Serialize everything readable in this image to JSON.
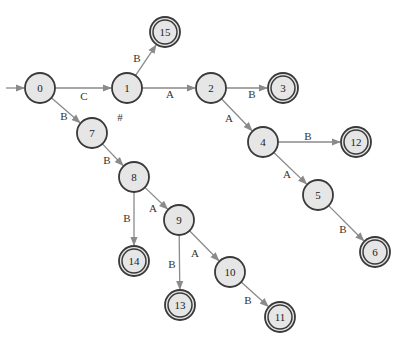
{
  "diagram": {
    "type": "state-machine",
    "colors": {
      "node_fill": "#e6e6e6",
      "node_stroke": "#3a3a3a",
      "edge": "#8a8a8a"
    },
    "start_state": "0",
    "nodes": [
      {
        "id": "0",
        "label": "0",
        "x": 40,
        "y": 88,
        "accepting": false
      },
      {
        "id": "1",
        "label": "1",
        "x": 127,
        "y": 88,
        "accepting": false
      },
      {
        "id": "2",
        "label": "2",
        "x": 211,
        "y": 88,
        "accepting": false
      },
      {
        "id": "3",
        "label": "3",
        "x": 283,
        "y": 88,
        "accepting": true
      },
      {
        "id": "15",
        "label": "15",
        "x": 165,
        "y": 32,
        "accepting": true
      },
      {
        "id": "7",
        "label": "7",
        "x": 92,
        "y": 133,
        "accepting": false
      },
      {
        "id": "8",
        "label": "8",
        "x": 134,
        "y": 177,
        "accepting": false
      },
      {
        "id": "4",
        "label": "4",
        "x": 263,
        "y": 142,
        "accepting": false
      },
      {
        "id": "12",
        "label": "12",
        "x": 356,
        "y": 142,
        "accepting": true
      },
      {
        "id": "5",
        "label": "5",
        "x": 318,
        "y": 195,
        "accepting": false
      },
      {
        "id": "6",
        "label": "6",
        "x": 375,
        "y": 252,
        "accepting": true
      },
      {
        "id": "9",
        "label": "9",
        "x": 179,
        "y": 220,
        "accepting": false
      },
      {
        "id": "14",
        "label": "14",
        "x": 134,
        "y": 261,
        "accepting": true
      },
      {
        "id": "10",
        "label": "10",
        "x": 230,
        "y": 272,
        "accepting": false
      },
      {
        "id": "13",
        "label": "13",
        "x": 180,
        "y": 305,
        "accepting": true
      },
      {
        "id": "11",
        "label": "11",
        "x": 280,
        "y": 317,
        "accepting": true
      }
    ],
    "edges": [
      {
        "from": "0",
        "to": "1",
        "label": "C",
        "lx": 84,
        "ly": 96
      },
      {
        "from": "0",
        "to": "7",
        "label": "B",
        "lx": 64,
        "ly": 116
      },
      {
        "from": "1",
        "to": "15",
        "label": "B",
        "lx": 137,
        "ly": 58
      },
      {
        "from": "1",
        "to": "2",
        "label": "A",
        "lx": 170,
        "ly": 94
      },
      {
        "from": "2",
        "to": "3",
        "label": "B",
        "lx": 252,
        "ly": 94
      },
      {
        "from": "2",
        "to": "4",
        "label": "A",
        "lx": 229,
        "ly": 118
      },
      {
        "from": "4",
        "to": "12",
        "label": "B",
        "lx": 308,
        "ly": 136
      },
      {
        "from": "4",
        "to": "5",
        "label": "A",
        "lx": 287,
        "ly": 174
      },
      {
        "from": "5",
        "to": "6",
        "label": "B",
        "lx": 343,
        "ly": 229
      },
      {
        "from": "7",
        "to": "8",
        "label": "B",
        "lx": 107,
        "ly": 160
      },
      {
        "from": "8",
        "to": "14",
        "label": "B",
        "lx": 127,
        "ly": 218
      },
      {
        "from": "8",
        "to": "9",
        "label": "A",
        "lx": 153,
        "ly": 208
      },
      {
        "from": "9",
        "to": "13",
        "label": "B",
        "lx": 172,
        "ly": 264
      },
      {
        "from": "9",
        "to": "10",
        "label": "A",
        "lx": 195,
        "ly": 253
      },
      {
        "from": "10",
        "to": "11",
        "label": "B",
        "lx": 248,
        "ly": 300
      }
    ],
    "annotations": [
      {
        "text": "#",
        "x": 120,
        "y": 117
      }
    ]
  }
}
